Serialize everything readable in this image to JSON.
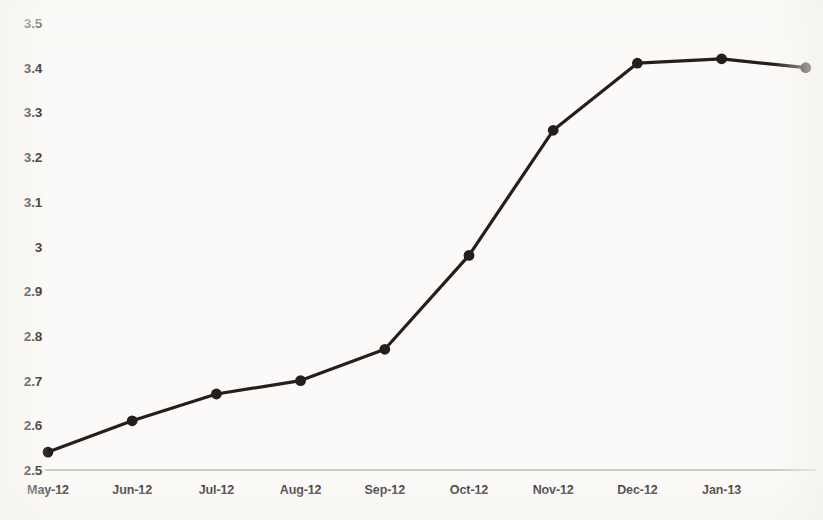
{
  "chart_data": {
    "type": "line",
    "title": "",
    "subtitle": "",
    "xlabel": "",
    "ylabel": "",
    "categories": [
      "May-12",
      "Jun-12",
      "Jul-12",
      "Aug-12",
      "Sep-12",
      "Oct-12",
      "Nov-12",
      "Dec-12",
      "Jan-13",
      ""
    ],
    "x_tick_labels": [
      "May-12",
      "Jun-12",
      "Jul-12",
      "Aug-12",
      "Sep-12",
      "Oct-12",
      "Nov-12",
      "Dec-12",
      "Jan-13"
    ],
    "values": [
      2.54,
      2.61,
      2.67,
      2.7,
      2.77,
      2.98,
      3.26,
      3.41,
      3.42,
      3.4
    ],
    "series": [
      {
        "name": "",
        "values": [
          2.54,
          2.61,
          2.67,
          2.7,
          2.77,
          2.98,
          3.26,
          3.41,
          3.42,
          3.4
        ]
      }
    ],
    "y_tick_labels": [
      "3.5",
      "3.4",
      "3.3",
      "3.2",
      "3.1",
      "3",
      "2.9",
      "2.8",
      "2.7",
      "2.6",
      "2.5"
    ],
    "y_ticks": [
      3.5,
      3.4,
      3.3,
      3.2,
      3.1,
      3.0,
      2.9,
      2.8,
      2.7,
      2.6,
      2.5
    ],
    "ylim": [
      2.5,
      3.5
    ],
    "grid": false,
    "legend": false,
    "legend_position": "none",
    "line_color": "#241f1c",
    "marker_color": "#241f1c",
    "axis_color": "#b9b8b4",
    "background_color": "#fbfaf8",
    "text_color": "#262220",
    "annotations": []
  }
}
